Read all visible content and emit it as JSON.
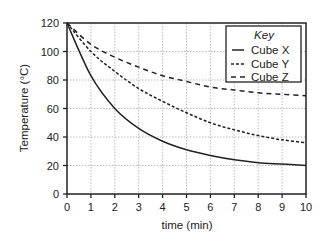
{
  "chart_data": {
    "type": "line",
    "title": "",
    "xlabel": "time (min)",
    "ylabel": "Temperature (°C)",
    "xlim": [
      0,
      10
    ],
    "ylim": [
      0,
      120
    ],
    "x_ticks": [
      0,
      1,
      2,
      3,
      4,
      5,
      6,
      7,
      8,
      9,
      10
    ],
    "y_ticks": [
      0,
      20,
      40,
      60,
      80,
      100,
      120
    ],
    "grid": true,
    "legend": {
      "title": "Key",
      "position": "top-right"
    },
    "x": [
      0,
      1,
      2,
      3,
      4,
      5,
      6,
      7,
      8,
      9,
      10
    ],
    "series": [
      {
        "name": "Cube X",
        "style": "solid",
        "values": [
          120,
          83,
          60,
          46,
          37,
          31,
          27,
          24,
          22,
          21,
          20
        ]
      },
      {
        "name": "Cube Y",
        "style": "short-dash",
        "values": [
          120,
          100,
          86,
          74,
          65,
          57,
          50,
          45,
          41,
          38,
          36
        ]
      },
      {
        "name": "Cube Z",
        "style": "long-dash",
        "values": [
          120,
          105,
          96,
          89,
          83,
          79,
          75,
          73,
          71,
          70,
          69
        ]
      }
    ]
  },
  "labels": {
    "xlabel": "time (min)",
    "ylabel": "Temperature (°C)",
    "legend_title": "Key",
    "legend_items": [
      "Cube X",
      "Cube Y",
      "Cube Z"
    ]
  }
}
